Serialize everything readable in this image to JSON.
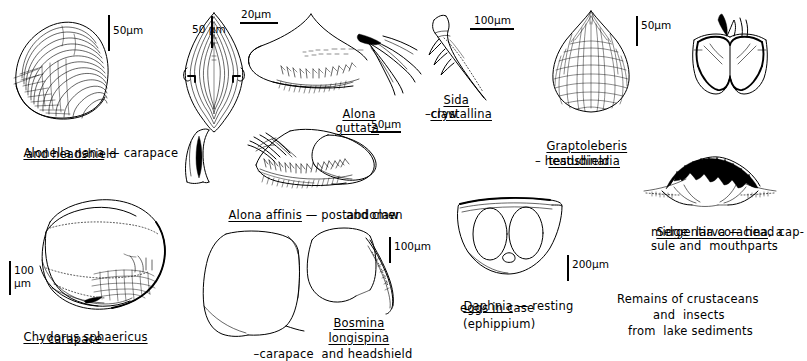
{
  "plate": {
    "title": "Remains of crustaceans and insects from lake sediments",
    "background_color": "#ffffff",
    "ink_color": "#000000",
    "width": 807,
    "height": 361
  },
  "captions": {
    "alonella": {
      "line1": "Alonella nana",
      "line2": " — carapace",
      "line3": "and headshield"
    },
    "alona_guttata": {
      "line1": "Alona",
      "line2": "guttata"
    },
    "sida": {
      "line1": "Sida",
      "line2": "crystallina",
      "line3": "–claw"
    },
    "graptoleberis": {
      "line1": "Graptoleberis",
      "line2": "testudinaria",
      "line3": "– headshield"
    },
    "alona_affinis": {
      "line1": "Alona affinis",
      "line2": " — postabdomen",
      "line3": "and claw"
    },
    "chydorus": {
      "line1": "Chydorus sphaericus",
      "line2": "– carapace"
    },
    "bosmina": {
      "line1": "Bosmina",
      "line2": "longispina",
      "line3": "–carapace",
      "line4": "and headshield"
    },
    "daphnia": {
      "line1": "Daphnia",
      "line2": " — resting",
      "line3": "eggs in case",
      "line4": "(ephippium)"
    },
    "sergentia": {
      "line1": "Sergentia coracina",
      "line2": ", a",
      "line3": "midge  larva — head cap-",
      "line4": "sule and  mouthparts"
    },
    "footer": {
      "line1": "Remains of crustaceans",
      "line2": "and  insects",
      "line3": "from  lake sediments"
    }
  },
  "scale_bars": [
    {
      "id": "alonella-carapace",
      "label": "50µm",
      "orientation": "vertical"
    },
    {
      "id": "alonella-headshield",
      "label": "50 µm",
      "orientation": "vertical"
    },
    {
      "id": "alona-guttata-top",
      "label": "20µm",
      "orientation": "horizontal"
    },
    {
      "id": "sida-claw",
      "label": "100µm",
      "orientation": "horizontal"
    },
    {
      "id": "graptoleberis",
      "label": "50µm",
      "orientation": "vertical"
    },
    {
      "id": "alona-affinis",
      "label": "50µm",
      "orientation": "horizontal"
    },
    {
      "id": "chydorus",
      "label_line1": "100",
      "label_line2": "µm",
      "orientation": "vertical"
    },
    {
      "id": "bosmina",
      "label": "100µm",
      "orientation": "vertical"
    },
    {
      "id": "daphnia",
      "label": "200µm",
      "orientation": "vertical"
    }
  ],
  "figures": [
    {
      "id": "alonella-nana-carapace",
      "name": "Alonella nana carapace"
    },
    {
      "id": "alonella-nana-headshield",
      "name": "Alonella nana headshield"
    },
    {
      "id": "alona-guttata-postabdomen",
      "name": "Alona guttata postabdomen"
    },
    {
      "id": "sida-crystallina-claw",
      "name": "Sida crystallina claw"
    },
    {
      "id": "graptoleberis-headshield",
      "name": "Graptoleberis testudinaria headshield"
    },
    {
      "id": "unlabeled-mandible",
      "name": "Dark chitinous head fragment"
    },
    {
      "id": "alona-affinis-claw",
      "name": "Alona affinis claw"
    },
    {
      "id": "alona-affinis-postabdomen",
      "name": "Alona affinis postabdomen"
    },
    {
      "id": "sergentia-head-capsule",
      "name": "Sergentia coracina head capsule and mouthparts"
    },
    {
      "id": "chydorus-carapace",
      "name": "Chydorus sphaericus carapace"
    },
    {
      "id": "bosmina-carapace",
      "name": "Bosmina longispina carapace"
    },
    {
      "id": "bosmina-headshield",
      "name": "Bosmina longispina headshield"
    },
    {
      "id": "daphnia-ephippium",
      "name": "Daphnia ephippium with resting eggs"
    }
  ]
}
